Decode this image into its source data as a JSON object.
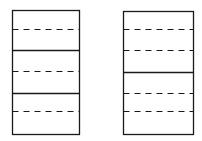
{
  "diagram": {
    "stroke_color": "#1a1a1a",
    "background": "#ffffff",
    "panels": [
      {
        "name": "left-panel",
        "x": 12,
        "y": 10,
        "width": 67,
        "height": 124,
        "lines": [
          {
            "y": 29,
            "style": "dashed"
          },
          {
            "y": 50,
            "style": "solid"
          },
          {
            "y": 71,
            "style": "dashed"
          },
          {
            "y": 93,
            "style": "solid"
          },
          {
            "y": 111,
            "style": "dashed"
          }
        ]
      },
      {
        "name": "right-panel",
        "x": 123,
        "y": 11,
        "width": 70,
        "height": 123,
        "lines": [
          {
            "y": 29,
            "style": "dashed"
          },
          {
            "y": 50,
            "style": "dashed"
          },
          {
            "y": 72,
            "style": "solid"
          },
          {
            "y": 93,
            "style": "dashed"
          },
          {
            "y": 111,
            "style": "dashed"
          }
        ]
      }
    ]
  }
}
